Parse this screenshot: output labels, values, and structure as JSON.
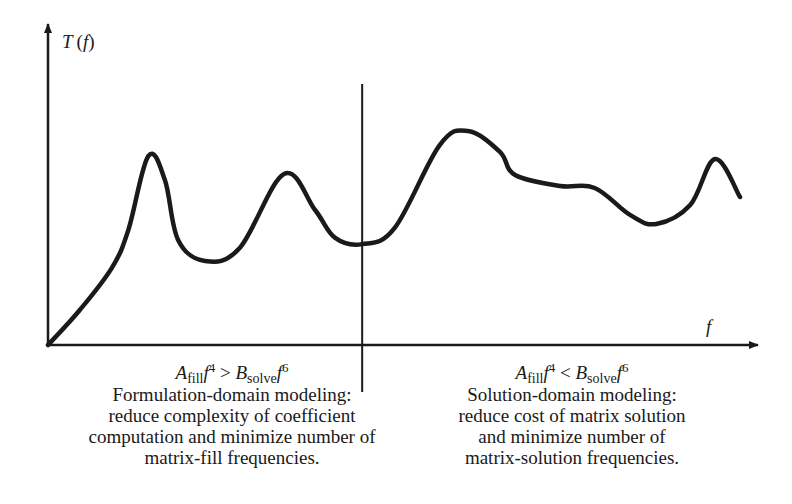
{
  "chart_data": {
    "type": "line",
    "title": "",
    "xlabel": "f",
    "ylabel": "T (f)",
    "xlim": [
      0,
      100
    ],
    "ylim": [
      0,
      100
    ],
    "grid": false,
    "divider_x": 45.4,
    "series": [
      {
        "name": "T(f)",
        "points": [
          [
            0,
            0
          ],
          [
            4.6,
            14.3
          ],
          [
            9.2,
            31.4
          ],
          [
            11.6,
            46.9
          ],
          [
            14.5,
            77.1
          ],
          [
            16.9,
            67.3
          ],
          [
            18.8,
            42.9
          ],
          [
            22.7,
            34.3
          ],
          [
            27.7,
            39.6
          ],
          [
            34.1,
            69.8
          ],
          [
            38.6,
            55.1
          ],
          [
            41.5,
            43.7
          ],
          [
            45.4,
            41.2
          ],
          [
            50.1,
            47.8
          ],
          [
            56.6,
            81.6
          ],
          [
            60.7,
            87.3
          ],
          [
            65.3,
            78.8
          ],
          [
            67.5,
            69.4
          ],
          [
            74.0,
            64.9
          ],
          [
            79.0,
            64.1
          ],
          [
            84.1,
            53.1
          ],
          [
            87.9,
            49.4
          ],
          [
            92.8,
            57.1
          ],
          [
            96.4,
            75.9
          ],
          [
            100,
            60.4
          ]
        ]
      }
    ]
  },
  "axes": {
    "y_label_main": "T",
    "y_label_arg": "(f)",
    "x_label": "f"
  },
  "regions": {
    "left": {
      "formula": {
        "a": "A",
        "a_sub": "fill",
        "f1": "f",
        "e1": "4",
        "op": " > ",
        "b": "B",
        "b_sub": "solve",
        "f2": "f",
        "e2": "6"
      },
      "lines": [
        "Formulation-domain modeling:",
        "reduce complexity of coefficient",
        "computation and minimize number of",
        "matrix-fill frequencies."
      ]
    },
    "right": {
      "formula": {
        "a": "A",
        "a_sub": "fill",
        "f1": "f",
        "e1": "4",
        "op": " < ",
        "b": "B",
        "b_sub": "solve",
        "f2": "f",
        "e2": "6"
      },
      "lines": [
        "Solution-domain modeling:",
        "reduce cost of matrix solution",
        "and minimize number of",
        "matrix-solution frequencies."
      ]
    }
  }
}
